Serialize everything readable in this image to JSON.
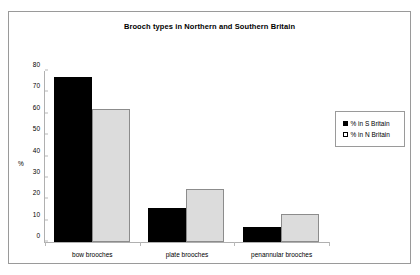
{
  "chart_data": {
    "type": "bar",
    "title": "Brooch types in Northern and Southern Britain",
    "xlabel": "",
    "ylabel": "%",
    "ylim": [
      0,
      80
    ],
    "yticks": [
      0,
      10,
      20,
      30,
      40,
      50,
      60,
      70,
      80
    ],
    "grid": false,
    "legend_position": "right",
    "categories": [
      "bow brooches",
      "plate brooches",
      "penannular brooches"
    ],
    "series": [
      {
        "name": "% in S Britain",
        "swatch": "filled-black-square",
        "color": "#000000",
        "values": [
          77,
          16,
          7
        ]
      },
      {
        "name": "% in N Britain",
        "swatch": "hollow-square",
        "color": "#dcdcdc",
        "values": [
          62,
          25,
          13
        ]
      }
    ]
  }
}
